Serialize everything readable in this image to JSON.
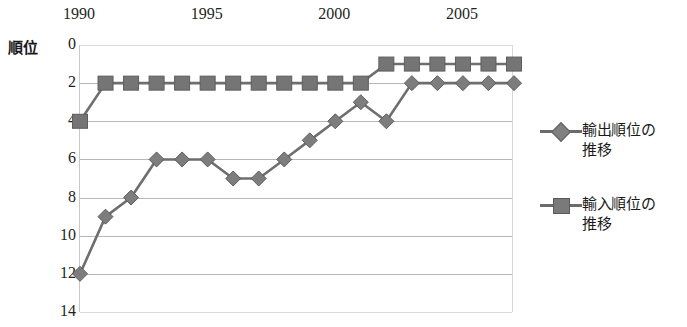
{
  "chart_data": {
    "type": "line",
    "title": "",
    "xlabel": "",
    "ylabel": "順位",
    "x": [
      1990,
      1991,
      1992,
      1993,
      1994,
      1995,
      1996,
      1997,
      1998,
      1999,
      2000,
      2001,
      2002,
      2003,
      2004,
      2005,
      2006,
      2007
    ],
    "xtick_labels": [
      "1990",
      "1995",
      "2000",
      "2005"
    ],
    "xtick_values": [
      1990,
      1995,
      2000,
      2005
    ],
    "ytick_labels": [
      "0",
      "2",
      "4",
      "6",
      "8",
      "10",
      "12",
      "14"
    ],
    "ytick_values": [
      0,
      2,
      4,
      6,
      8,
      10,
      12,
      14
    ],
    "ylim": [
      0,
      14
    ],
    "y_inverted": true,
    "grid": true,
    "legend_position": "right",
    "series": [
      {
        "name": "輸出順位の\n推移",
        "marker": "diamond",
        "color": "#7d7d7d",
        "values": [
          12,
          9,
          8,
          6,
          6,
          6,
          7,
          7,
          6,
          5,
          4,
          3,
          4,
          2,
          2,
          2,
          2,
          2
        ]
      },
      {
        "name": "輸入順位の\n推移",
        "marker": "square",
        "color": "#757575",
        "values": [
          4,
          2,
          2,
          2,
          2,
          2,
          2,
          2,
          2,
          2,
          2,
          2,
          1,
          1,
          1,
          1,
          1,
          1
        ]
      }
    ]
  },
  "axis": {
    "y_title": "順位"
  },
  "legend": {
    "items": [
      {
        "label": "輸出順位の\n推移",
        "marker": "diamond"
      },
      {
        "label": "輸入順位の\n推移",
        "marker": "square"
      }
    ]
  },
  "colors": {
    "series_export": "#7d7d7d",
    "series_import": "#757575",
    "grid": "#b7b7b7",
    "text": "#231f20"
  }
}
